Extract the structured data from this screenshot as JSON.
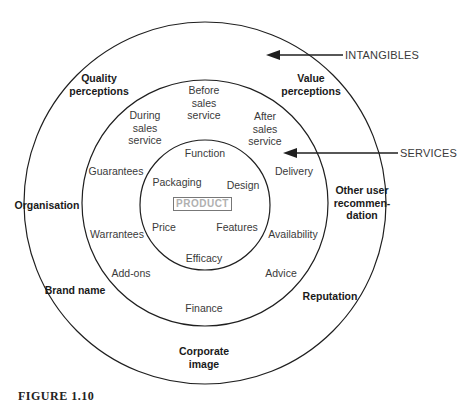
{
  "diagram": {
    "core": {
      "label": "PRODUCT"
    },
    "product_ring": {
      "items": [
        "Function",
        "Packaging",
        "Design",
        "Price",
        "Features",
        "Efficacy"
      ]
    },
    "services_ring": {
      "items": [
        "Before\nsales\nservice",
        "During\nsales\nservice",
        "After\nsales\nservice",
        "Guarantees",
        "Delivery",
        "Warrantees",
        "Availability",
        "Add-ons",
        "Advice",
        "Finance"
      ]
    },
    "intangibles_ring": {
      "items": [
        "Quality\nperceptions",
        "Value\nperceptions",
        "Organisation",
        "Other user\nrecommen-\ndation",
        "Brand name",
        "Reputation",
        "Corporate\nimage"
      ]
    },
    "arrows": {
      "intangibles": "INTANGIBLES",
      "services": "SERVICES"
    },
    "caption": "FIGURE 1.10"
  },
  "colors": {
    "line": "#1f1f1f",
    "text": "#3a3a3a",
    "product_text": "#b0b0b0",
    "product_border": "#777777"
  }
}
